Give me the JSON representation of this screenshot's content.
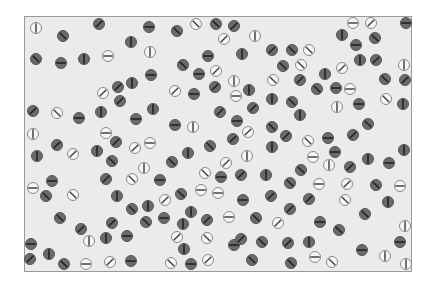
{
  "colors": {
    "background": "#ffffff",
    "frame_fill": "#ebebeb",
    "frame_border": "#9a9a9a",
    "dark_fill": "#6a6a6a",
    "dark_ring": "#555555",
    "dark_line": "#1e1e1e",
    "light_fill": "#f6f6f6",
    "light_ring": "#8a8a8a",
    "light_line": "#444444"
  },
  "circle_radius": 5.5,
  "legend": {
    "orientations": [
      "vertical",
      "horizontal",
      "diag-slash",
      "diag-backslash"
    ],
    "types": [
      "dark",
      "light"
    ]
  },
  "circles": [
    {
      "x": 36,
      "y": 28,
      "t": "light",
      "o": "v"
    },
    {
      "x": 63,
      "y": 36,
      "t": "dark",
      "o": "b"
    },
    {
      "x": 99,
      "y": 24,
      "t": "dark",
      "o": "s"
    },
    {
      "x": 36,
      "y": 59,
      "t": "dark",
      "o": "b"
    },
    {
      "x": 61,
      "y": 63,
      "t": "dark",
      "o": "h"
    },
    {
      "x": 84,
      "y": 59,
      "t": "dark",
      "o": "v"
    },
    {
      "x": 108,
      "y": 56,
      "t": "light",
      "o": "h"
    },
    {
      "x": 131,
      "y": 42,
      "t": "dark",
      "o": "v"
    },
    {
      "x": 149,
      "y": 27,
      "t": "dark",
      "o": "h"
    },
    {
      "x": 150,
      "y": 52,
      "t": "light",
      "o": "v"
    },
    {
      "x": 151,
      "y": 75,
      "t": "dark",
      "o": "h"
    },
    {
      "x": 118,
      "y": 87,
      "t": "dark",
      "o": "s"
    },
    {
      "x": 132,
      "y": 83,
      "t": "dark",
      "o": "v"
    },
    {
      "x": 103,
      "y": 93,
      "t": "light",
      "o": "s"
    },
    {
      "x": 177,
      "y": 31,
      "t": "dark",
      "o": "b"
    },
    {
      "x": 196,
      "y": 24,
      "t": "light",
      "o": "b"
    },
    {
      "x": 216,
      "y": 24,
      "t": "dark",
      "o": "b"
    },
    {
      "x": 234,
      "y": 26,
      "t": "dark",
      "o": "s"
    },
    {
      "x": 224,
      "y": 39,
      "t": "light",
      "o": "s"
    },
    {
      "x": 255,
      "y": 36,
      "t": "light",
      "o": "v"
    },
    {
      "x": 208,
      "y": 56,
      "t": "dark",
      "o": "h"
    },
    {
      "x": 242,
      "y": 54,
      "t": "dark",
      "o": "v"
    },
    {
      "x": 272,
      "y": 50,
      "t": "dark",
      "o": "s"
    },
    {
      "x": 183,
      "y": 65,
      "t": "dark",
      "o": "b"
    },
    {
      "x": 199,
      "y": 74,
      "t": "dark",
      "o": "h"
    },
    {
      "x": 216,
      "y": 71,
      "t": "light",
      "o": "s"
    },
    {
      "x": 234,
      "y": 81,
      "t": "light",
      "o": "v"
    },
    {
      "x": 273,
      "y": 80,
      "t": "light",
      "o": "b"
    },
    {
      "x": 175,
      "y": 91,
      "t": "light",
      "o": "s"
    },
    {
      "x": 194,
      "y": 94,
      "t": "dark",
      "o": "h"
    },
    {
      "x": 215,
      "y": 87,
      "t": "dark",
      "o": "s"
    },
    {
      "x": 236,
      "y": 96,
      "t": "light",
      "o": "h"
    },
    {
      "x": 249,
      "y": 90,
      "t": "dark",
      "o": "v"
    },
    {
      "x": 353,
      "y": 23,
      "t": "light",
      "o": "h"
    },
    {
      "x": 371,
      "y": 23,
      "t": "light",
      "o": "s"
    },
    {
      "x": 342,
      "y": 35,
      "t": "dark",
      "o": "v"
    },
    {
      "x": 356,
      "y": 45,
      "t": "dark",
      "o": "h"
    },
    {
      "x": 375,
      "y": 38,
      "t": "dark",
      "o": "b"
    },
    {
      "x": 406,
      "y": 23,
      "t": "dark",
      "o": "h"
    },
    {
      "x": 309,
      "y": 50,
      "t": "light",
      "o": "b"
    },
    {
      "x": 292,
      "y": 50,
      "t": "dark",
      "o": "b"
    },
    {
      "x": 283,
      "y": 66,
      "t": "dark",
      "o": "b"
    },
    {
      "x": 301,
      "y": 65,
      "t": "light",
      "o": "b"
    },
    {
      "x": 360,
      "y": 60,
      "t": "dark",
      "o": "v"
    },
    {
      "x": 376,
      "y": 60,
      "t": "dark",
      "o": "s"
    },
    {
      "x": 404,
      "y": 65,
      "t": "light",
      "o": "v"
    },
    {
      "x": 342,
      "y": 68,
      "t": "light",
      "o": "s"
    },
    {
      "x": 325,
      "y": 74,
      "t": "dark",
      "o": "v"
    },
    {
      "x": 300,
      "y": 80,
      "t": "dark",
      "o": "s"
    },
    {
      "x": 317,
      "y": 89,
      "t": "dark",
      "o": "b"
    },
    {
      "x": 336,
      "y": 88,
      "t": "dark",
      "o": "h"
    },
    {
      "x": 350,
      "y": 89,
      "t": "light",
      "o": "h"
    },
    {
      "x": 385,
      "y": 79,
      "t": "dark",
      "o": "b"
    },
    {
      "x": 405,
      "y": 80,
      "t": "dark",
      "o": "s"
    },
    {
      "x": 33,
      "y": 111,
      "t": "dark",
      "o": "s"
    },
    {
      "x": 57,
      "y": 113,
      "t": "light",
      "o": "b"
    },
    {
      "x": 79,
      "y": 118,
      "t": "dark",
      "o": "h"
    },
    {
      "x": 101,
      "y": 112,
      "t": "dark",
      "o": "v"
    },
    {
      "x": 120,
      "y": 101,
      "t": "dark",
      "o": "s"
    },
    {
      "x": 136,
      "y": 119,
      "t": "dark",
      "o": "h"
    },
    {
      "x": 33,
      "y": 134,
      "t": "light",
      "o": "v"
    },
    {
      "x": 57,
      "y": 145,
      "t": "dark",
      "o": "s"
    },
    {
      "x": 73,
      "y": 154,
      "t": "light",
      "o": "s"
    },
    {
      "x": 97,
      "y": 151,
      "t": "dark",
      "o": "v"
    },
    {
      "x": 106,
      "y": 133,
      "t": "light",
      "o": "h"
    },
    {
      "x": 116,
      "y": 142,
      "t": "dark",
      "o": "s"
    },
    {
      "x": 135,
      "y": 148,
      "t": "light",
      "o": "s"
    },
    {
      "x": 150,
      "y": 143,
      "t": "light",
      "o": "h"
    },
    {
      "x": 37,
      "y": 156,
      "t": "dark",
      "o": "v"
    },
    {
      "x": 112,
      "y": 161,
      "t": "dark",
      "o": "b"
    },
    {
      "x": 144,
      "y": 168,
      "t": "light",
      "o": "v"
    },
    {
      "x": 52,
      "y": 181,
      "t": "dark",
      "o": "h"
    },
    {
      "x": 106,
      "y": 179,
      "t": "dark",
      "o": "s"
    },
    {
      "x": 132,
      "y": 179,
      "t": "light",
      "o": "b"
    },
    {
      "x": 153,
      "y": 109,
      "t": "dark",
      "o": "v"
    },
    {
      "x": 175,
      "y": 125,
      "t": "dark",
      "o": "h"
    },
    {
      "x": 193,
      "y": 127,
      "t": "light",
      "o": "v"
    },
    {
      "x": 220,
      "y": 112,
      "t": "dark",
      "o": "s"
    },
    {
      "x": 237,
      "y": 121,
      "t": "dark",
      "o": "h"
    },
    {
      "x": 253,
      "y": 108,
      "t": "dark",
      "o": "s"
    },
    {
      "x": 272,
      "y": 99,
      "t": "dark",
      "o": "v"
    },
    {
      "x": 248,
      "y": 132,
      "t": "light",
      "o": "s"
    },
    {
      "x": 233,
      "y": 139,
      "t": "dark",
      "o": "s"
    },
    {
      "x": 272,
      "y": 127,
      "t": "dark",
      "o": "b"
    },
    {
      "x": 210,
      "y": 146,
      "t": "dark",
      "o": "b"
    },
    {
      "x": 188,
      "y": 153,
      "t": "dark",
      "o": "v"
    },
    {
      "x": 172,
      "y": 162,
      "t": "dark",
      "o": "b"
    },
    {
      "x": 226,
      "y": 163,
      "t": "light",
      "o": "s"
    },
    {
      "x": 247,
      "y": 156,
      "t": "light",
      "o": "v"
    },
    {
      "x": 272,
      "y": 147,
      "t": "dark",
      "o": "v"
    },
    {
      "x": 205,
      "y": 173,
      "t": "light",
      "o": "b"
    },
    {
      "x": 160,
      "y": 180,
      "t": "dark",
      "o": "h"
    },
    {
      "x": 221,
      "y": 177,
      "t": "dark",
      "o": "h"
    },
    {
      "x": 241,
      "y": 175,
      "t": "dark",
      "o": "s"
    },
    {
      "x": 266,
      "y": 175,
      "t": "dark",
      "o": "v"
    },
    {
      "x": 292,
      "y": 102,
      "t": "dark",
      "o": "b"
    },
    {
      "x": 300,
      "y": 115,
      "t": "dark",
      "o": "v"
    },
    {
      "x": 337,
      "y": 107,
      "t": "light",
      "o": "v"
    },
    {
      "x": 359,
      "y": 104,
      "t": "dark",
      "o": "h"
    },
    {
      "x": 386,
      "y": 99,
      "t": "light",
      "o": "b"
    },
    {
      "x": 403,
      "y": 104,
      "t": "dark",
      "o": "v"
    },
    {
      "x": 368,
      "y": 124,
      "t": "dark",
      "o": "b"
    },
    {
      "x": 286,
      "y": 136,
      "t": "dark",
      "o": "s"
    },
    {
      "x": 308,
      "y": 141,
      "t": "light",
      "o": "b"
    },
    {
      "x": 328,
      "y": 138,
      "t": "dark",
      "o": "h"
    },
    {
      "x": 353,
      "y": 135,
      "t": "dark",
      "o": "s"
    },
    {
      "x": 335,
      "y": 152,
      "t": "dark",
      "o": "h"
    },
    {
      "x": 313,
      "y": 157,
      "t": "light",
      "o": "h"
    },
    {
      "x": 329,
      "y": 165,
      "t": "light",
      "o": "v"
    },
    {
      "x": 350,
      "y": 167,
      "t": "dark",
      "o": "s"
    },
    {
      "x": 368,
      "y": 159,
      "t": "dark",
      "o": "v"
    },
    {
      "x": 389,
      "y": 163,
      "t": "dark",
      "o": "h"
    },
    {
      "x": 404,
      "y": 150,
      "t": "dark",
      "o": "v"
    },
    {
      "x": 301,
      "y": 170,
      "t": "dark",
      "o": "b"
    },
    {
      "x": 33,
      "y": 188,
      "t": "light",
      "o": "h"
    },
    {
      "x": 46,
      "y": 196,
      "t": "dark",
      "o": "b"
    },
    {
      "x": 73,
      "y": 195,
      "t": "light",
      "o": "b"
    },
    {
      "x": 117,
      "y": 196,
      "t": "dark",
      "o": "v"
    },
    {
      "x": 132,
      "y": 209,
      "t": "dark",
      "o": "b"
    },
    {
      "x": 148,
      "y": 206,
      "t": "dark",
      "o": "v"
    },
    {
      "x": 146,
      "y": 222,
      "t": "dark",
      "o": "b"
    },
    {
      "x": 60,
      "y": 218,
      "t": "dark",
      "o": "b"
    },
    {
      "x": 112,
      "y": 223,
      "t": "dark",
      "o": "s"
    },
    {
      "x": 81,
      "y": 229,
      "t": "dark",
      "o": "s"
    },
    {
      "x": 89,
      "y": 241,
      "t": "light",
      "o": "v"
    },
    {
      "x": 106,
      "y": 238,
      "t": "dark",
      "o": "v"
    },
    {
      "x": 127,
      "y": 236,
      "t": "dark",
      "o": "h"
    },
    {
      "x": 31,
      "y": 244,
      "t": "dark",
      "o": "h"
    },
    {
      "x": 30,
      "y": 259,
      "t": "dark",
      "o": "s"
    },
    {
      "x": 49,
      "y": 254,
      "t": "dark",
      "o": "v"
    },
    {
      "x": 64,
      "y": 264,
      "t": "dark",
      "o": "b"
    },
    {
      "x": 86,
      "y": 264,
      "t": "light",
      "o": "h"
    },
    {
      "x": 110,
      "y": 262,
      "t": "light",
      "o": "s"
    },
    {
      "x": 131,
      "y": 261,
      "t": "dark",
      "o": "h"
    },
    {
      "x": 165,
      "y": 200,
      "t": "light",
      "o": "s"
    },
    {
      "x": 181,
      "y": 194,
      "t": "dark",
      "o": "b"
    },
    {
      "x": 201,
      "y": 190,
      "t": "light",
      "o": "h"
    },
    {
      "x": 218,
      "y": 193,
      "t": "light",
      "o": "h"
    },
    {
      "x": 243,
      "y": 200,
      "t": "dark",
      "o": "h"
    },
    {
      "x": 271,
      "y": 196,
      "t": "dark",
      "o": "s"
    },
    {
      "x": 164,
      "y": 218,
      "t": "dark",
      "o": "h"
    },
    {
      "x": 191,
      "y": 212,
      "t": "dark",
      "o": "v"
    },
    {
      "x": 183,
      "y": 224,
      "t": "dark",
      "o": "v"
    },
    {
      "x": 207,
      "y": 220,
      "t": "dark",
      "o": "s"
    },
    {
      "x": 229,
      "y": 217,
      "t": "light",
      "o": "h"
    },
    {
      "x": 256,
      "y": 218,
      "t": "dark",
      "o": "b"
    },
    {
      "x": 177,
      "y": 237,
      "t": "light",
      "o": "s"
    },
    {
      "x": 207,
      "y": 238,
      "t": "light",
      "o": "b"
    },
    {
      "x": 234,
      "y": 245,
      "t": "dark",
      "o": "h"
    },
    {
      "x": 241,
      "y": 239,
      "t": "dark",
      "o": "s"
    },
    {
      "x": 262,
      "y": 242,
      "t": "dark",
      "o": "b"
    },
    {
      "x": 184,
      "y": 249,
      "t": "dark",
      "o": "v"
    },
    {
      "x": 171,
      "y": 263,
      "t": "light",
      "o": "b"
    },
    {
      "x": 191,
      "y": 264,
      "t": "dark",
      "o": "h"
    },
    {
      "x": 208,
      "y": 260,
      "t": "light",
      "o": "s"
    },
    {
      "x": 252,
      "y": 260,
      "t": "dark",
      "o": "b"
    },
    {
      "x": 290,
      "y": 183,
      "t": "dark",
      "o": "b"
    },
    {
      "x": 319,
      "y": 184,
      "t": "light",
      "o": "h"
    },
    {
      "x": 347,
      "y": 184,
      "t": "light",
      "o": "s"
    },
    {
      "x": 376,
      "y": 185,
      "t": "dark",
      "o": "b"
    },
    {
      "x": 400,
      "y": 186,
      "t": "light",
      "o": "h"
    },
    {
      "x": 309,
      "y": 199,
      "t": "dark",
      "o": "s"
    },
    {
      "x": 345,
      "y": 200,
      "t": "light",
      "o": "b"
    },
    {
      "x": 388,
      "y": 202,
      "t": "dark",
      "o": "v"
    },
    {
      "x": 290,
      "y": 209,
      "t": "dark",
      "o": "s"
    },
    {
      "x": 365,
      "y": 214,
      "t": "dark",
      "o": "b"
    },
    {
      "x": 278,
      "y": 223,
      "t": "light",
      "o": "s"
    },
    {
      "x": 320,
      "y": 222,
      "t": "dark",
      "o": "h"
    },
    {
      "x": 339,
      "y": 230,
      "t": "dark",
      "o": "b"
    },
    {
      "x": 405,
      "y": 226,
      "t": "light",
      "o": "v"
    },
    {
      "x": 288,
      "y": 243,
      "t": "dark",
      "o": "s"
    },
    {
      "x": 309,
      "y": 242,
      "t": "dark",
      "o": "v"
    },
    {
      "x": 400,
      "y": 242,
      "t": "dark",
      "o": "h"
    },
    {
      "x": 362,
      "y": 250,
      "t": "dark",
      "o": "h"
    },
    {
      "x": 385,
      "y": 256,
      "t": "light",
      "o": "v"
    },
    {
      "x": 315,
      "y": 257,
      "t": "light",
      "o": "h"
    },
    {
      "x": 332,
      "y": 262,
      "t": "light",
      "o": "b"
    },
    {
      "x": 291,
      "y": 263,
      "t": "dark",
      "o": "b"
    },
    {
      "x": 406,
      "y": 264,
      "t": "light",
      "o": "v"
    }
  ]
}
